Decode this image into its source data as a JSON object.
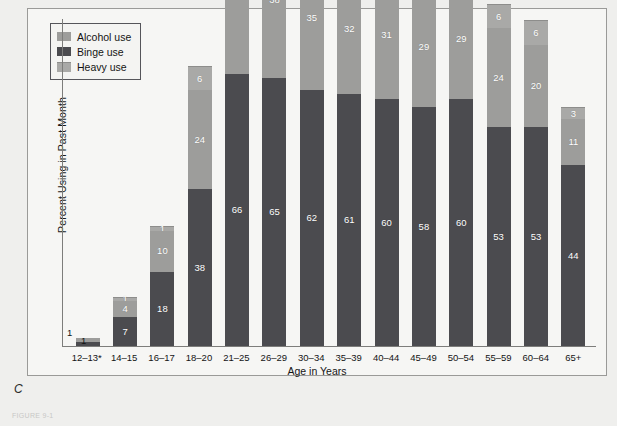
{
  "figure": {
    "panel_letter": "C",
    "caption": "FIGURE 9-1",
    "colors": {
      "alcohol": "#9d9d9b",
      "binge": "#4b4b4f",
      "heavy": "#a9a9a7",
      "axis": "#7d7d7b",
      "panel_border": "#9a9a98",
      "background": "#f6f6f4"
    }
  },
  "legend": {
    "items": [
      {
        "label": "Alcohol use",
        "swatch": "alcohol"
      },
      {
        "label": "Binge use",
        "swatch": "binge"
      },
      {
        "label": "Heavy use",
        "swatch": "heavy"
      }
    ]
  },
  "chart_data": {
    "type": "bar",
    "title": "",
    "xlabel": "Age in Years",
    "ylabel": "Percent Using in Past Month",
    "ylim": [
      0,
      80
    ],
    "grid": false,
    "stacked": true,
    "legend_position": "top-left",
    "categories": [
      "12–13*",
      "14–15",
      "16–17",
      "18–20",
      "21–25",
      "26–29",
      "30–34",
      "35–39",
      "40–44",
      "45–49",
      "50–54",
      "55–59",
      "60–64",
      "65+"
    ],
    "series": [
      {
        "name": "Binge use",
        "color": "#4b4b4f",
        "values": [
          1,
          7,
          18,
          38,
          66,
          65,
          62,
          61,
          60,
          58,
          60,
          53,
          53,
          44
        ]
      },
      {
        "name": "Alcohol use",
        "color": "#9d9d9b",
        "values": [
          1,
          4,
          10,
          24,
          42,
          38,
          35,
          32,
          31,
          29,
          29,
          24,
          20,
          11
        ]
      },
      {
        "name": "Heavy use",
        "color": "#a9a9a7",
        "values": [
          0,
          1,
          1,
          6,
          11,
          9,
          9,
          8,
          7,
          7,
          7,
          6,
          6,
          3
        ]
      }
    ]
  }
}
